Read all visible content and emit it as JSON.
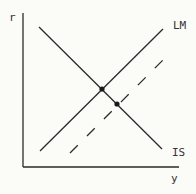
{
  "diagram": {
    "axes": {
      "y_label": "r",
      "x_label": "y"
    },
    "curves": [
      {
        "name": "LM",
        "label": "LM",
        "style": "solid",
        "slope": "upward"
      },
      {
        "name": "LM-shifted",
        "label": "",
        "style": "dashed",
        "slope": "upward",
        "note": "LM shifted right/down"
      },
      {
        "name": "IS",
        "label": "IS",
        "style": "solid",
        "slope": "downward"
      }
    ],
    "equilibria": [
      {
        "name": "initial",
        "between": [
          "IS",
          "LM"
        ]
      },
      {
        "name": "new",
        "between": [
          "IS",
          "LM-shifted"
        ]
      }
    ]
  }
}
